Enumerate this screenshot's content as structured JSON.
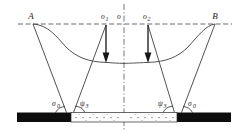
{
  "figure": {
    "background_color": "#ffffff",
    "line_color": "#3a3a3a",
    "dark_fill": "#0d0d0d",
    "deck_fill": "#fdfdfd",
    "width": 248,
    "height": 134
  },
  "labels": {
    "anchor_left": "A",
    "anchor_right": "B",
    "pylon_left_base": "o",
    "pylon_left_sub": "1",
    "center_axis": "o",
    "pylon_right_base": "o",
    "pylon_right_sub": "2",
    "sigma_left_base": "σ",
    "sigma_left_sub": "0",
    "sigma_right_base": "σ",
    "sigma_right_sub": "0",
    "psi_left_base": "ψ",
    "psi_left_sub": "3",
    "psi_right_base": "ψ",
    "psi_right_sub": "3"
  },
  "geometry": {
    "datum_line_y": 24,
    "deck_top_y": 113,
    "deck_bottom_y": 122,
    "center_x": 124,
    "anchor_left_x": 33,
    "anchor_right_x": 215,
    "load_left_x": 106,
    "load_right_x": 148,
    "curve_low_y": 62,
    "support_left_x": 70,
    "support_right_x": 179
  },
  "elements": {
    "datum": "horizontal-dashed-reference-line",
    "axis": "vertical-dash-dot-centerline",
    "cable_curve": "sagging-cable-parabola",
    "arrow_left": "downward-load-arrow",
    "arrow_right": "downward-load-arrow",
    "deck": "hatched-deck-segment",
    "abutment_left": "solid-black-abutment",
    "abutment_right": "solid-black-abutment"
  }
}
